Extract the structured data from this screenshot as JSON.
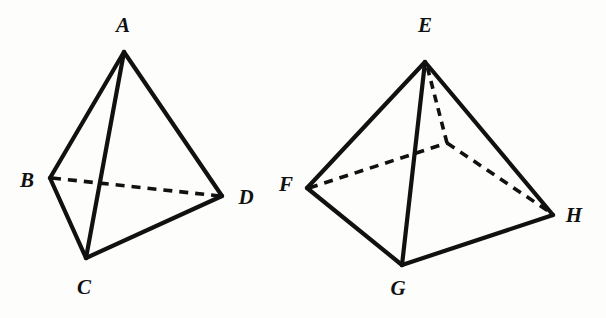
{
  "figure": {
    "background_color": "#fdfdfb",
    "ink_color": "#111111",
    "shapes": [
      {
        "name": "tetrahedron",
        "label": "Tetrahedron ABCD",
        "vertices": [
          {
            "id": "A",
            "label": "A",
            "x": 124,
            "y": 52,
            "label_x": 123,
            "label_y": 25
          },
          {
            "id": "B",
            "label": "B",
            "x": 50,
            "y": 178,
            "label_x": 27,
            "label_y": 180
          },
          {
            "id": "C",
            "label": "C",
            "x": 86,
            "y": 258,
            "label_x": 84,
            "label_y": 287
          },
          {
            "id": "D",
            "label": "D",
            "x": 222,
            "y": 196,
            "label_x": 246,
            "label_y": 197
          }
        ],
        "solid_edges": [
          [
            "A",
            "B"
          ],
          [
            "A",
            "C"
          ],
          [
            "A",
            "D"
          ],
          [
            "B",
            "C"
          ],
          [
            "C",
            "D"
          ]
        ],
        "dashed_edges": [
          [
            "B",
            "D"
          ]
        ]
      },
      {
        "name": "square-pyramid",
        "label": "Square pyramid EFGH",
        "vertices": [
          {
            "id": "E",
            "label": "E",
            "x": 425,
            "y": 62,
            "label_x": 425,
            "label_y": 25
          },
          {
            "id": "F",
            "label": "F",
            "x": 307,
            "y": 188,
            "label_x": 286,
            "label_y": 184
          },
          {
            "id": "G",
            "label": "G",
            "x": 402,
            "y": 265,
            "label_x": 398,
            "label_y": 288
          },
          {
            "id": "H",
            "label": "H",
            "x": 553,
            "y": 215,
            "label_x": 574,
            "label_y": 215
          },
          {
            "id": "K",
            "label": "",
            "x": 447,
            "y": 143,
            "label_x": 0,
            "label_y": 0,
            "hidden": true
          }
        ],
        "solid_edges": [
          [
            "E",
            "F"
          ],
          [
            "E",
            "G"
          ],
          [
            "E",
            "H"
          ],
          [
            "F",
            "G"
          ],
          [
            "G",
            "H"
          ]
        ],
        "dashed_edges": [
          [
            "F",
            "K"
          ],
          [
            "K",
            "H"
          ],
          [
            "K",
            "E"
          ]
        ]
      }
    ]
  }
}
